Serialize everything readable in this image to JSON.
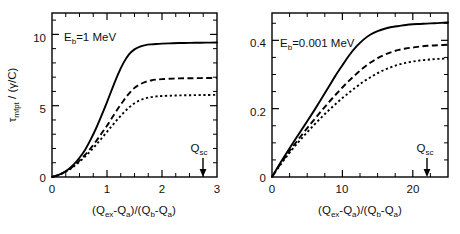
{
  "figure": {
    "background_color": "#ffffff",
    "line_color": "#000000"
  },
  "chart_data": [
    {
      "type": "line",
      "panel": "left",
      "title": "",
      "annotation": "E_b=1 MeV",
      "annotation_parts": {
        "base": "E",
        "sub": "b",
        "rest": "=1 MeV"
      },
      "xlabel": "(Q_ex-Q_a)/(Q_b-Q_a)",
      "xlabel_parts": [
        {
          "t": "(Q",
          "sub": false
        },
        {
          "t": "ex",
          "sub": true
        },
        {
          "t": "-Q",
          "sub": false
        },
        {
          "t": "a",
          "sub": true
        },
        {
          "t": ")/(Q",
          "sub": false
        },
        {
          "t": "b",
          "sub": true
        },
        {
          "t": "-Q",
          "sub": false
        },
        {
          "t": "a",
          "sub": true
        },
        {
          "t": ")",
          "sub": false
        }
      ],
      "ylabel": "τ_mfpt / (γ/C)",
      "ylabel_parts": [
        {
          "t": "τ",
          "sub": false
        },
        {
          "t": "mfpt",
          "sub": true
        },
        {
          "t": " / (γ/C)",
          "sub": false
        }
      ],
      "xlim": [
        0,
        3
      ],
      "ylim": [
        0,
        11.5
      ],
      "xticks": [
        0,
        1,
        2,
        3
      ],
      "xticklabels": [
        "0",
        "1",
        "2",
        "3"
      ],
      "xticks_minor_step": 0.25,
      "yticks": [
        0,
        5,
        10
      ],
      "yticklabels": [
        "0",
        "5",
        "10"
      ],
      "yticks_minor_step": 1,
      "grid": false,
      "legend": "none",
      "markers": [
        {
          "name": "Q_sc",
          "label": "Q_sc",
          "label_parts": {
            "base": "Q",
            "sub": "sc"
          },
          "x": 2.75,
          "style": "down-arrow"
        }
      ],
      "series": [
        {
          "name": "solid",
          "style": "solid",
          "x": [
            0,
            0.1,
            0.2,
            0.3,
            0.4,
            0.5,
            0.6,
            0.7,
            0.8,
            0.9,
            1.0,
            1.1,
            1.2,
            1.3,
            1.4,
            1.5,
            1.6,
            1.7,
            1.8,
            1.9,
            2.0,
            2.2,
            2.4,
            2.6,
            2.8,
            3.0
          ],
          "values": [
            0,
            0.12,
            0.3,
            0.55,
            0.9,
            1.35,
            1.9,
            2.6,
            3.4,
            4.3,
            5.25,
            6.25,
            7.2,
            8.0,
            8.6,
            8.95,
            9.15,
            9.25,
            9.3,
            9.33,
            9.35,
            9.38,
            9.4,
            9.41,
            9.42,
            9.43
          ]
        },
        {
          "name": "dashed",
          "style": "dashed",
          "x": [
            0,
            0.1,
            0.2,
            0.3,
            0.4,
            0.5,
            0.6,
            0.7,
            0.8,
            0.9,
            1.0,
            1.1,
            1.2,
            1.3,
            1.4,
            1.5,
            1.6,
            1.7,
            1.8,
            1.9,
            2.0,
            2.2,
            2.4,
            2.6,
            2.8,
            3.0
          ],
          "values": [
            0,
            0.11,
            0.28,
            0.5,
            0.8,
            1.15,
            1.55,
            2.0,
            2.5,
            3.05,
            3.6,
            4.2,
            4.8,
            5.35,
            5.85,
            6.25,
            6.5,
            6.67,
            6.77,
            6.83,
            6.86,
            6.9,
            6.92,
            6.93,
            6.94,
            6.95
          ]
        },
        {
          "name": "dotted",
          "style": "dotted",
          "x": [
            0,
            0.1,
            0.2,
            0.3,
            0.4,
            0.5,
            0.6,
            0.7,
            0.8,
            0.9,
            1.0,
            1.1,
            1.2,
            1.3,
            1.4,
            1.5,
            1.6,
            1.7,
            1.8,
            1.9,
            2.0,
            2.2,
            2.4,
            2.6,
            2.8,
            3.0
          ],
          "values": [
            0,
            0.11,
            0.27,
            0.48,
            0.75,
            1.07,
            1.43,
            1.82,
            2.25,
            2.7,
            3.17,
            3.63,
            4.08,
            4.5,
            4.87,
            5.17,
            5.38,
            5.52,
            5.6,
            5.65,
            5.68,
            5.71,
            5.73,
            5.74,
            5.75,
            5.76
          ]
        }
      ]
    },
    {
      "type": "line",
      "panel": "right",
      "title": "",
      "annotation": "E_b=0.001 MeV",
      "annotation_parts": {
        "base": "E",
        "sub": "b",
        "rest": "=0.001 MeV"
      },
      "xlabel": "(Q_ex-Q_a)/(Q_b-Q_a)",
      "xlabel_parts": [
        {
          "t": "(Q",
          "sub": false
        },
        {
          "t": "ex",
          "sub": true
        },
        {
          "t": "-Q",
          "sub": false
        },
        {
          "t": "a",
          "sub": true
        },
        {
          "t": ")/(Q",
          "sub": false
        },
        {
          "t": "b",
          "sub": true
        },
        {
          "t": "-Q",
          "sub": false
        },
        {
          "t": "a",
          "sub": true
        },
        {
          "t": ")",
          "sub": false
        }
      ],
      "ylabel": "",
      "xlim": [
        0,
        25
      ],
      "ylim": [
        0,
        0.48
      ],
      "xticks": [
        0,
        10,
        20
      ],
      "xticklabels": [
        "0",
        "10",
        "20"
      ],
      "xticks_minor_step": 2.5,
      "yticks": [
        0,
        0.2,
        0.4
      ],
      "yticklabels": [
        "0",
        "0.2",
        "0.4"
      ],
      "yticks_minor_step": 0.05,
      "grid": false,
      "legend": "none",
      "markers": [
        {
          "name": "Q_sc",
          "label": "Q_sc",
          "label_parts": {
            "base": "Q",
            "sub": "sc"
          },
          "x": 22,
          "style": "down-arrow"
        }
      ],
      "series": [
        {
          "name": "solid",
          "style": "solid",
          "x": [
            0,
            1,
            2,
            3,
            4,
            5,
            6,
            7,
            8,
            9,
            10,
            11,
            12,
            13,
            14,
            15,
            16,
            17,
            18,
            19,
            20,
            21,
            22,
            23,
            24,
            25
          ],
          "values": [
            0,
            0.035,
            0.068,
            0.1,
            0.132,
            0.163,
            0.195,
            0.228,
            0.262,
            0.296,
            0.327,
            0.357,
            0.382,
            0.402,
            0.417,
            0.427,
            0.434,
            0.439,
            0.442,
            0.445,
            0.447,
            0.448,
            0.449,
            0.45,
            0.451,
            0.452
          ]
        },
        {
          "name": "dashed",
          "style": "dashed",
          "x": [
            0,
            1,
            2,
            3,
            4,
            5,
            6,
            7,
            8,
            9,
            10,
            11,
            12,
            13,
            14,
            15,
            16,
            17,
            18,
            19,
            20,
            21,
            22,
            23,
            24,
            25
          ],
          "values": [
            0,
            0.032,
            0.062,
            0.09,
            0.117,
            0.143,
            0.168,
            0.193,
            0.217,
            0.24,
            0.262,
            0.283,
            0.302,
            0.32,
            0.335,
            0.348,
            0.358,
            0.366,
            0.372,
            0.376,
            0.379,
            0.382,
            0.384,
            0.385,
            0.386,
            0.387
          ]
        },
        {
          "name": "dotted",
          "style": "dotted",
          "x": [
            0,
            1,
            2,
            3,
            4,
            5,
            6,
            7,
            8,
            9,
            10,
            11,
            12,
            13,
            14,
            15,
            16,
            17,
            18,
            19,
            20,
            21,
            22,
            23,
            24,
            25
          ],
          "values": [
            0,
            0.03,
            0.058,
            0.084,
            0.108,
            0.131,
            0.153,
            0.174,
            0.194,
            0.213,
            0.231,
            0.248,
            0.264,
            0.279,
            0.292,
            0.304,
            0.314,
            0.322,
            0.329,
            0.334,
            0.338,
            0.341,
            0.343,
            0.345,
            0.346,
            0.347
          ]
        }
      ]
    }
  ],
  "left_panel": {
    "yticklabels": [
      "10",
      "5",
      "0"
    ],
    "xticklabels": [
      "0",
      "1",
      "2",
      "3"
    ],
    "annotation_base": "E",
    "annotation_sub": "b",
    "annotation_rest": "=1 MeV",
    "marker_base": "Q",
    "marker_sub": "sc"
  },
  "right_panel": {
    "yticklabels": [
      "0.4",
      "0.2",
      "0"
    ],
    "xticklabels": [
      "0",
      "10",
      "20"
    ],
    "annotation_base": "E",
    "annotation_sub": "b",
    "annotation_rest": "=0.001 MeV",
    "marker_base": "Q",
    "marker_sub": "sc"
  },
  "axis_titles": {
    "x_p1": "(Q",
    "x_s1": "ex",
    "x_p2": "-Q",
    "x_s2": "a",
    "x_p3": ")/(Q",
    "x_s3": "b",
    "x_p4": "-Q",
    "x_s4": "a",
    "x_p5": ")",
    "y_p1": "τ",
    "y_s1": "mfpt",
    "y_p2": " / (γ/C)"
  }
}
